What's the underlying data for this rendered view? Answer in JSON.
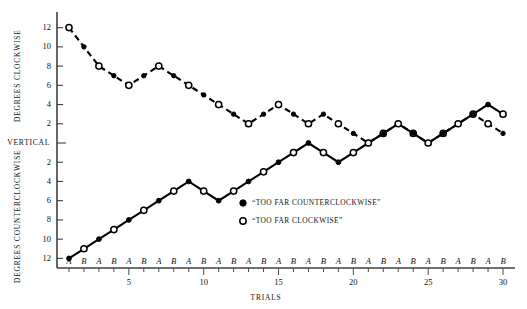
{
  "chart_data": {
    "type": "line",
    "title": "",
    "xlabel": "TRIALS",
    "ylabel_upper": "DEGREES CLOCKWISE",
    "ylabel_lower": "DEGREES COUNTERCLOCKWISE",
    "origin_label": "VERTICAL",
    "grid": false,
    "legend_position": "inside-lower-right",
    "xlim": [
      0.2,
      30.8
    ],
    "ylim": [
      -13,
      13
    ],
    "x": [
      1,
      2,
      3,
      4,
      5,
      6,
      7,
      8,
      9,
      10,
      11,
      12,
      13,
      14,
      15,
      16,
      17,
      18,
      19,
      20,
      21,
      22,
      23,
      24,
      25,
      26,
      27,
      28,
      29,
      30
    ],
    "x_tick_values": [
      5,
      10,
      15,
      20,
      25,
      30
    ],
    "x_tick_labels": [
      "5",
      "10",
      "15",
      "20",
      "25",
      "30"
    ],
    "x_sublabels": [
      "A",
      "B",
      "A",
      "B",
      "A",
      "B",
      "A",
      "B",
      "A",
      "B",
      "A",
      "B",
      "A",
      "B",
      "A",
      "B",
      "A",
      "B",
      "A",
      "B",
      "A",
      "B",
      "A",
      "B",
      "A",
      "B",
      "A",
      "B",
      "A",
      "B"
    ],
    "y_tick_values": [
      12,
      10,
      8,
      6,
      4,
      2,
      0,
      -2,
      -4,
      -6,
      -8,
      -10,
      -12
    ],
    "y_tick_labels": [
      "12",
      "10",
      "8",
      "6",
      "4",
      "2",
      "VERTICAL",
      "2",
      "4",
      "6",
      "8",
      "10",
      "12"
    ],
    "series": [
      {
        "name": "“TOO FAR COUNTERCLOCKWISE”",
        "marker": "filled-circle",
        "linestyle": "solid",
        "color": "#000000",
        "values": [
          -12,
          -11,
          -10,
          -9,
          -8,
          -7,
          -6,
          -5,
          -4,
          -5,
          -6,
          -5,
          -4,
          -3,
          -2,
          -1,
          0,
          -1,
          -2,
          -1,
          0,
          1,
          2,
          1,
          0,
          1,
          2,
          3,
          4,
          3
        ]
      },
      {
        "name": "“TOO FAR CLOCKWISE”",
        "marker": "open-circle",
        "linestyle": "dashed",
        "color": "#000000",
        "values": [
          12,
          10,
          8,
          7,
          6,
          7,
          8,
          7,
          6,
          5,
          4,
          3,
          2,
          3,
          4,
          3,
          2,
          3,
          2,
          1,
          0,
          1,
          2,
          1,
          0,
          1,
          2,
          3,
          2,
          1
        ]
      }
    ]
  },
  "legend": {
    "entries": [
      {
        "label": "“TOO FAR COUNTERCLOCKWISE”",
        "marker": "filled-circle"
      },
      {
        "label": "“TOO FAR CLOCKWISE”",
        "marker": "open-circle"
      }
    ]
  }
}
